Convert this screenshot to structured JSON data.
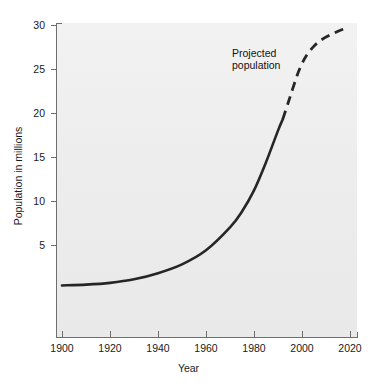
{
  "chart_data": {
    "type": "line",
    "title": "",
    "xlabel": "Year",
    "ylabel": "Population in millions",
    "xlim": [
      1900,
      2020
    ],
    "ylim": [
      0,
      30
    ],
    "grid": false,
    "legend_position": "none",
    "x_ticks": [
      "1900",
      "1920",
      "1940",
      "1960",
      "1980",
      "2000",
      "2020"
    ],
    "x_tick_values": [
      1900,
      1920,
      1940,
      1960,
      1980,
      2000,
      2020
    ],
    "y_ticks": [
      "5",
      "10",
      "15",
      "20",
      "25",
      "30"
    ],
    "y_tick_values": [
      5,
      10,
      15,
      20,
      25,
      30
    ],
    "annotations": [
      {
        "name": "projected-population-label",
        "line1": "Projected",
        "line2": "population",
        "x": 1988,
        "y": 26
      }
    ],
    "series": [
      {
        "name": "Observed population",
        "style": "solid",
        "x": [
          1900,
          1910,
          1920,
          1930,
          1940,
          1950,
          1960,
          1970,
          1975,
          1980,
          1985,
          1990,
          1992
        ],
        "values": [
          0.4,
          0.5,
          0.7,
          1.1,
          1.8,
          2.8,
          4.4,
          7.0,
          8.8,
          11.2,
          14.4,
          18.0,
          19.3
        ]
      },
      {
        "name": "Projected population",
        "style": "dashed",
        "x": [
          1992,
          1995,
          1998,
          2000,
          2002,
          2005,
          2008,
          2012,
          2016,
          2018
        ],
        "values": [
          19.3,
          21.8,
          24.3,
          25.6,
          26.6,
          27.6,
          28.3,
          28.9,
          29.4,
          29.6
        ]
      }
    ]
  },
  "colors": {
    "curve": "#262626",
    "axis": "#6e6e6e",
    "plot_background": "#ededed",
    "page_background": "#ffffff",
    "text": "#1a1a1a"
  }
}
